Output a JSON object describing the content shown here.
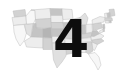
{
  "graphic": {
    "kind": "choropleth-thumbnail",
    "subject": "United States map",
    "background_color": "#ffffff",
    "overlay": {
      "label": "4",
      "color": "#0d0d0d",
      "position": "center"
    },
    "map": {
      "outline_color": "#b9b9b9",
      "fill_palette": [
        "#f7f7f7",
        "#ededed",
        "#e0e0e0",
        "#d2d2d2",
        "#c4c4c4",
        "#b5b5b5",
        "#a8a8a8"
      ],
      "regions": [
        {
          "name": "washington",
          "shade": "#d2d2d2"
        },
        {
          "name": "oregon",
          "shade": "#ededed"
        },
        {
          "name": "california",
          "shade": "#f7f7f7"
        },
        {
          "name": "nevada",
          "shade": "#e0e0e0"
        },
        {
          "name": "idaho",
          "shade": "#f7f7f7"
        },
        {
          "name": "montana",
          "shade": "#ededed"
        },
        {
          "name": "wyoming",
          "shade": "#d2d2d2"
        },
        {
          "name": "utah",
          "shade": "#c4c4c4"
        },
        {
          "name": "arizona",
          "shade": "#ededed"
        },
        {
          "name": "colorado",
          "shade": "#b5b5b5"
        },
        {
          "name": "new-mexico",
          "shade": "#d2d2d2"
        },
        {
          "name": "north-dakota",
          "shade": "#c4c4c4"
        },
        {
          "name": "south-dakota",
          "shade": "#ededed"
        },
        {
          "name": "nebraska",
          "shade": "#d2d2d2"
        },
        {
          "name": "kansas",
          "shade": "#c4c4c4"
        },
        {
          "name": "oklahoma",
          "shade": "#ededed"
        },
        {
          "name": "texas",
          "shade": "#e0e0e0"
        },
        {
          "name": "minnesota",
          "shade": "#ededed"
        },
        {
          "name": "iowa",
          "shade": "#c4c4c4"
        },
        {
          "name": "missouri",
          "shade": "#d2d2d2"
        },
        {
          "name": "arkansas",
          "shade": "#ededed"
        },
        {
          "name": "louisiana",
          "shade": "#d2d2d2"
        },
        {
          "name": "wisconsin",
          "shade": "#d2d2d2"
        },
        {
          "name": "illinois",
          "shade": "#ededed"
        },
        {
          "name": "michigan",
          "shade": "#e0e0e0"
        },
        {
          "name": "indiana",
          "shade": "#c4c4c4"
        },
        {
          "name": "ohio",
          "shade": "#ededed"
        },
        {
          "name": "kentucky",
          "shade": "#d2d2d2"
        },
        {
          "name": "tennessee",
          "shade": "#ededed"
        },
        {
          "name": "mississippi",
          "shade": "#c4c4c4"
        },
        {
          "name": "alabama",
          "shade": "#ededed"
        },
        {
          "name": "georgia",
          "shade": "#d2d2d2"
        },
        {
          "name": "florida",
          "shade": "#f7f7f7"
        },
        {
          "name": "south-carolina",
          "shade": "#ededed"
        },
        {
          "name": "north-carolina",
          "shade": "#d2d2d2"
        },
        {
          "name": "virginia",
          "shade": "#ededed"
        },
        {
          "name": "west-virginia",
          "shade": "#c4c4c4"
        },
        {
          "name": "pennsylvania",
          "shade": "#d2d2d2"
        },
        {
          "name": "new-york",
          "shade": "#ededed"
        },
        {
          "name": "maine",
          "shade": "#d2d2d2"
        },
        {
          "name": "vermont",
          "shade": "#ededed"
        },
        {
          "name": "new-hampshire",
          "shade": "#c4c4c4"
        },
        {
          "name": "massachusetts",
          "shade": "#d2d2d2"
        },
        {
          "name": "connecticut",
          "shade": "#ededed"
        },
        {
          "name": "rhode-island",
          "shade": "#c4c4c4"
        },
        {
          "name": "new-jersey",
          "shade": "#c4c4c4"
        },
        {
          "name": "delaware",
          "shade": "#d2d2d2"
        },
        {
          "name": "maryland",
          "shade": "#ededed"
        }
      ]
    }
  }
}
